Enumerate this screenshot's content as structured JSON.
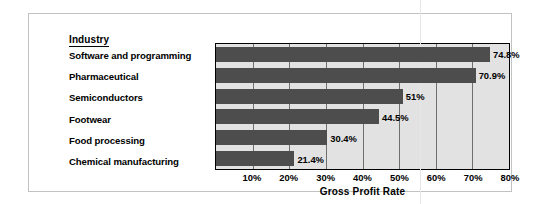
{
  "legend": {
    "header": "Industry"
  },
  "axis": {
    "x_title": "Gross Profit Rate",
    "ticks": [
      "10%",
      "20%",
      "30%",
      "40%",
      "50%",
      "60%",
      "70%",
      "80%"
    ]
  },
  "colors": {
    "bar": "#4d4d4d",
    "plot_background": "#e2e2e2",
    "frame_border": "#c2c2c2",
    "axis_line": "#000000",
    "gridline": "#6f6f6f"
  },
  "chart_data": {
    "type": "bar",
    "orientation": "horizontal",
    "title": "",
    "xlabel": "Gross Profit Rate",
    "ylabel": "Industry",
    "xlim": [
      0,
      80
    ],
    "grid": true,
    "legend_position": "none",
    "categories": [
      "Software and programming",
      "Pharmaceutical",
      "Semiconductors",
      "Footwear",
      "Food processing",
      "Chemical manufacturing"
    ],
    "values": [
      74.8,
      70.9,
      51,
      44.5,
      30.4,
      21.4
    ],
    "data_labels": [
      "74.8%",
      "70.9%",
      "51%",
      "44.5%",
      "30.4%",
      "21.4%"
    ],
    "tick_values": [
      10,
      20,
      30,
      40,
      50,
      60,
      70,
      80
    ],
    "tick_labels": [
      "10%",
      "20%",
      "30%",
      "40%",
      "50%",
      "60%",
      "70%",
      "80%"
    ]
  }
}
